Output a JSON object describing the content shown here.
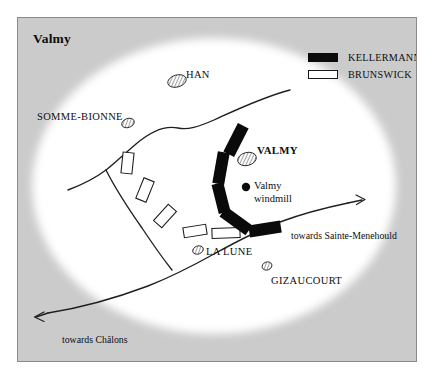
{
  "map": {
    "title": "Valmy",
    "background_color": "#cbcbcb",
    "field_color": "#ffffff",
    "border_color": "#8a8a8a",
    "ink_color": "#1a1a1a"
  },
  "legend": {
    "items": [
      {
        "label": "KELLERMANN",
        "swatch": "filled-rectangle",
        "color": "#0a0a0a"
      },
      {
        "label": "BRUNSWICK",
        "swatch": "outlined-rectangle",
        "color": "#ffffff"
      }
    ]
  },
  "places": [
    {
      "name": "HAN",
      "style": "caps",
      "marker": "hatched-oval"
    },
    {
      "name": "SOMME-BIONNE",
      "style": "caps",
      "marker": "hatched-oval"
    },
    {
      "name": "VALMY",
      "style": "bold-caps",
      "marker": "hatched-oval"
    },
    {
      "name": "LA LUNE",
      "style": "caps",
      "marker": "hatched-oval"
    },
    {
      "name": "GIZAUCOURT",
      "style": "caps",
      "marker": "hatched-oval"
    }
  ],
  "landmark": {
    "line1": "Valmy",
    "line2": "windmill",
    "marker": "filled-dot"
  },
  "roads": [
    {
      "label": "towards Sainte-Menehould",
      "direction": "east"
    },
    {
      "label": "towards Châlons",
      "direction": "west"
    }
  ],
  "units": {
    "kellermann": {
      "count": 5,
      "fill": "#0a0a0a"
    },
    "brunswick": {
      "count": 5,
      "fill": "#ffffff"
    }
  }
}
